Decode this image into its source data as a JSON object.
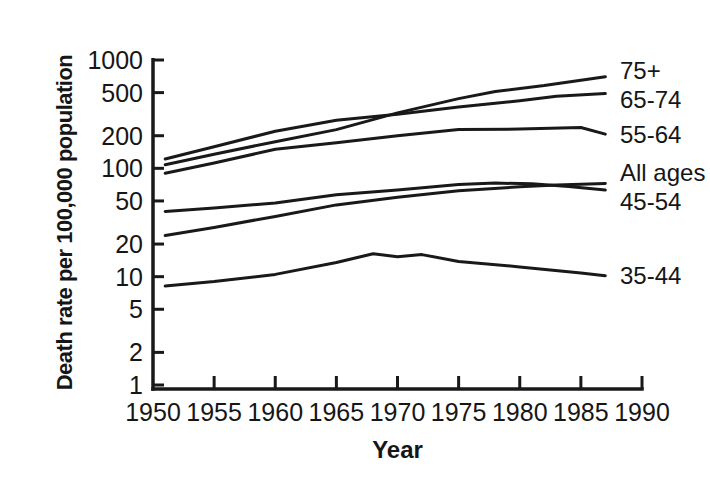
{
  "figure": {
    "background_color": "#ffffff",
    "ink_color": "#191919"
  },
  "chart_data": {
    "type": "line",
    "title": "",
    "xlabel": "Year",
    "ylabel": "Death rate per 100,000 population",
    "grid": false,
    "y_scale": "log",
    "y_range": [
      1,
      1000
    ],
    "y_ticks": [
      1000,
      500,
      200,
      100,
      50,
      20,
      10,
      5,
      2,
      1
    ],
    "x_range": [
      1950,
      1990
    ],
    "x_ticks": [
      1950,
      1955,
      1960,
      1965,
      1970,
      1975,
      1980,
      1985,
      1990
    ],
    "legend_position": "right-of-line-ends",
    "series": [
      {
        "name": "75+",
        "points": [
          [
            1951,
            108
          ],
          [
            1955,
            135
          ],
          [
            1960,
            176
          ],
          [
            1965,
            228
          ],
          [
            1970,
            325
          ],
          [
            1975,
            440
          ],
          [
            1978,
            512
          ],
          [
            1982,
            580
          ],
          [
            1987,
            700
          ]
        ]
      },
      {
        "name": "65-74",
        "points": [
          [
            1951,
            122
          ],
          [
            1955,
            158
          ],
          [
            1960,
            220
          ],
          [
            1965,
            278
          ],
          [
            1970,
            315
          ],
          [
            1975,
            368
          ],
          [
            1980,
            420
          ],
          [
            1983,
            462
          ],
          [
            1987,
            490
          ]
        ]
      },
      {
        "name": "55-64",
        "points": [
          [
            1951,
            90
          ],
          [
            1955,
            112
          ],
          [
            1960,
            150
          ],
          [
            1965,
            172
          ],
          [
            1970,
            200
          ],
          [
            1975,
            228
          ],
          [
            1980,
            230
          ],
          [
            1985,
            238
          ],
          [
            1987,
            207
          ]
        ]
      },
      {
        "name": "All ages",
        "points": [
          [
            1951,
            24
          ],
          [
            1955,
            28.5
          ],
          [
            1960,
            36
          ],
          [
            1965,
            46
          ],
          [
            1970,
            54
          ],
          [
            1975,
            62
          ],
          [
            1980,
            67.5
          ],
          [
            1983,
            70
          ],
          [
            1987,
            72.5
          ]
        ]
      },
      {
        "name": "45-54",
        "points": [
          [
            1951,
            40
          ],
          [
            1955,
            43
          ],
          [
            1960,
            48
          ],
          [
            1965,
            57
          ],
          [
            1970,
            63
          ],
          [
            1975,
            71
          ],
          [
            1978,
            73
          ],
          [
            1981,
            72
          ],
          [
            1984,
            68
          ],
          [
            1987,
            63
          ]
        ]
      },
      {
        "name": "35-44",
        "points": [
          [
            1951,
            8.2
          ],
          [
            1955,
            9
          ],
          [
            1960,
            10.5
          ],
          [
            1965,
            13.5
          ],
          [
            1968,
            16.3
          ],
          [
            1970,
            15.3
          ],
          [
            1972,
            16
          ],
          [
            1975,
            13.8
          ],
          [
            1980,
            12.3
          ],
          [
            1985,
            10.8
          ],
          [
            1987,
            10.2
          ]
        ]
      }
    ]
  }
}
